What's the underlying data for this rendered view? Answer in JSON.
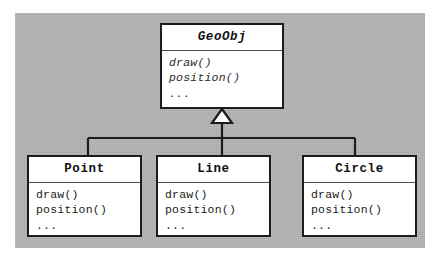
{
  "diagram": {
    "type": "uml-class-diagram",
    "relationship": "generalization",
    "arrow": "hollow-triangle-inheritance",
    "background_color": "#b3b3b3",
    "box_fill_color": "#ffffff",
    "line_color": "#1c1c1c"
  },
  "superclass": {
    "name": "GeoObj",
    "stereotype": "abstract",
    "members": [
      "draw()",
      "position()",
      "..."
    ]
  },
  "subclasses": [
    {
      "name": "Point",
      "members": [
        "draw()",
        "position()",
        "..."
      ]
    },
    {
      "name": "Line",
      "members": [
        "draw()",
        "position()",
        "..."
      ]
    },
    {
      "name": "Circle",
      "members": [
        "draw()",
        "position()",
        "..."
      ]
    }
  ]
}
